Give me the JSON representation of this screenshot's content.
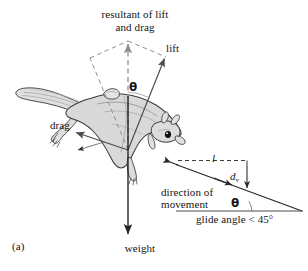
{
  "figure": {
    "panel_label": "(a)",
    "caption_subject": "flying squirrel glide force diagram"
  },
  "labels": {
    "resultant_line1": "resultant of lift",
    "resultant_line2": "and drag",
    "lift": "lift",
    "drag": "drag",
    "weight": "weight",
    "theta_main": "θ",
    "horizontal_distance": "l",
    "vertical_drop_base": "d",
    "vertical_drop_sub": "v",
    "direction_line1": "direction of",
    "direction_line2": "movement",
    "theta_glide": "θ",
    "glide_angle": "glide angle < 45°"
  },
  "colors": {
    "background": "#ffffff",
    "ink": "#141414",
    "vector_solid": "#4a4a4a",
    "vector_dashed": "#8a8a8a",
    "body_fill": "#d9d9d9",
    "body_fill_light": "#e6e6e6",
    "body_outline": "#3a3a3a",
    "fur_line": "#9a9a9a",
    "eye": "#101010"
  },
  "geometry": {
    "origin_x": 128,
    "origin_y": 150,
    "resultant_tip": [
      128,
      41
    ],
    "lift_tip": [
      166,
      57
    ],
    "drag_tip": [
      74,
      132
    ],
    "weight_tip": [
      128,
      236
    ],
    "glide_start": [
      172,
      163
    ],
    "glide_end": [
      300,
      211
    ],
    "glide_angle_deg": 20,
    "baseline_y": 211,
    "baseline_x_start": 178,
    "baseline_x_end": 303,
    "dashed_l_y": 160,
    "dashed_l_x_start": 178,
    "dashed_l_x_end": 247,
    "drop_x": 247,
    "drop_y_start": 160,
    "drop_y_end": 191
  }
}
